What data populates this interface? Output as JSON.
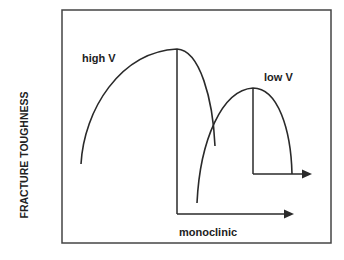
{
  "diagram": {
    "y_axis_label": "FRACTURE TOUGHNESS",
    "curves": [
      {
        "label": "high V",
        "description": "larger, taller toughness curve"
      },
      {
        "label": "low V",
        "description": "smaller, shorter toughness curve shifted right"
      }
    ],
    "arrow_label": "monoclinic",
    "colors": {
      "line": "#2a2a2a",
      "frame": "#444444",
      "background": "#ffffff"
    }
  }
}
